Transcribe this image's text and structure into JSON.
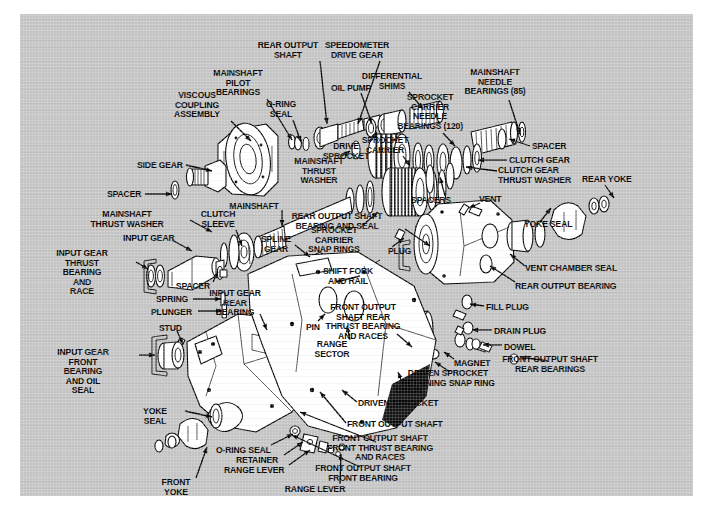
{
  "diagram": {
    "type": "exploded-parts-diagram",
    "background_color": "#c4c4c4",
    "line_color": "#000000",
    "part_fill_color": "#ffffff",
    "canvas": {
      "x": 20,
      "y": 14,
      "width": 673,
      "height": 482
    },
    "labels": [
      {
        "id": "rear-output-shaft",
        "text": "REAR OUTPUT\nSHAFT",
        "x": 268,
        "y": 27,
        "align": "center",
        "leader": [
          [
            300,
            47
          ],
          [
            307,
            110
          ]
        ]
      },
      {
        "id": "speedometer-drive-gear",
        "text": "SPEEDOMETER\nDRIVE GEAR",
        "x": 337,
        "y": 27,
        "align": "center",
        "leader": [
          [
            360,
            47
          ],
          [
            338,
            110
          ]
        ]
      },
      {
        "id": "mainshaft-pilot-bearings",
        "text": "MAINSHAFT\nPILOT\nBEARINGS",
        "x": 218,
        "y": 55,
        "align": "center",
        "leader": [
          [
            247,
            85
          ],
          [
            272,
            126
          ]
        ]
      },
      {
        "id": "differential-shims",
        "text": "DIFFERENTIAL\nSHIMS",
        "x": 372,
        "y": 58,
        "align": "center",
        "leader": [
          [
            389,
            78
          ],
          [
            403,
            95
          ]
        ]
      },
      {
        "id": "mainshaft-needle-bearings",
        "text": "MAINSHAFT\nNEEDLE\nBEARINGS (85)",
        "x": 475,
        "y": 54,
        "align": "center",
        "leader": [
          [
            489,
            86
          ],
          [
            500,
            120
          ]
        ]
      },
      {
        "id": "oil-pump",
        "text": "OIL PUMP",
        "x": 311,
        "y": 70,
        "align": "left",
        "leader": [
          [
            341,
            79
          ],
          [
            352,
            110
          ]
        ]
      },
      {
        "id": "viscous-coupling-assembly",
        "text": "VISCOUS\nCOUPLING\nASSEMBLY",
        "x": 177,
        "y": 77,
        "align": "center",
        "leader": [
          [
            211,
            107
          ],
          [
            231,
            127
          ]
        ]
      },
      {
        "id": "o-ring-seal-top",
        "text": "O-RING\nSEAL",
        "x": 261,
        "y": 86,
        "align": "center",
        "leader": [
          [
            273,
            106
          ],
          [
            281,
            128
          ]
        ]
      },
      {
        "id": "sprocket-carrier-needle-bearings",
        "text": "SPROCKET\nCARRIER\nNEEDLE\nBEARINGS (120)",
        "x": 410,
        "y": 79,
        "align": "center",
        "leader": [
          [
            423,
            119
          ],
          [
            435,
            132
          ]
        ]
      },
      {
        "id": "drive-sprocket",
        "text": "DRIVE\nSPROCKET",
        "x": 326,
        "y": 128,
        "align": "center",
        "leader": [
          [
            350,
            128
          ],
          [
            357,
            118
          ]
        ]
      },
      {
        "id": "spacer-top-right",
        "text": "SPACER",
        "x": 512,
        "y": 128,
        "align": "left",
        "leader": [
          [
            510,
            132
          ],
          [
            489,
            125
          ]
        ]
      },
      {
        "id": "sprocket-carrier",
        "text": "SPROCKET\nCARRIER",
        "x": 365,
        "y": 122,
        "align": "center",
        "leader": [
          [
            383,
            142
          ],
          [
            390,
            152
          ]
        ]
      },
      {
        "id": "side-gear",
        "text": "SIDE GEAR",
        "x": 117,
        "y": 147,
        "align": "left",
        "leader": [
          [
            166,
            151
          ],
          [
            192,
            157
          ]
        ]
      },
      {
        "id": "clutch-gear",
        "text": "CLUTCH GEAR",
        "x": 489,
        "y": 142,
        "align": "left",
        "leader": [
          [
            487,
            146
          ],
          [
            458,
            146
          ]
        ]
      },
      {
        "id": "clutch-gear-thrust-washer",
        "text": "CLUTCH GEAR\nTHRUST WASHER",
        "x": 478,
        "y": 152,
        "align": "left",
        "leader": [
          [
            477,
            157
          ],
          [
            446,
            153
          ]
        ]
      },
      {
        "id": "mainshaft-thrust-washer-top",
        "text": "MAINSHAFT\nTHRUST\nWASHER",
        "x": 299,
        "y": 143,
        "align": "center",
        "leader": [
          [
            320,
            143
          ],
          [
            330,
            137
          ]
        ]
      },
      {
        "id": "rear-yoke",
        "text": "REAR YOKE",
        "x": 562,
        "y": 161,
        "align": "left",
        "leader": [
          [
            585,
            171
          ],
          [
            594,
            184
          ]
        ]
      },
      {
        "id": "spacer-left",
        "text": "SPACER",
        "x": 87,
        "y": 176,
        "align": "left",
        "leader": [
          [
            125,
            180
          ],
          [
            152,
            180
          ]
        ]
      },
      {
        "id": "mainshaft-thrust-washer-left",
        "text": "MAINSHAFT\nTHRUST WASHER",
        "x": 107,
        "y": 196,
        "align": "center",
        "leader": [
          [
            170,
            206
          ],
          [
            192,
            218
          ]
        ]
      },
      {
        "id": "clutch-sleeve",
        "text": "CLUTCH\nSLEEVE",
        "x": 198,
        "y": 196,
        "align": "center",
        "leader": [
          [
            216,
            216
          ],
          [
            222,
            232
          ]
        ]
      },
      {
        "id": "mainshaft",
        "text": "MAINSHAFT",
        "x": 234,
        "y": 188,
        "align": "center",
        "leader": [
          [
            262,
            196
          ],
          [
            262,
            212
          ]
        ]
      },
      {
        "id": "spacers-group",
        "text": "SPACERS",
        "x": 411,
        "y": 182,
        "align": "center",
        "leader": [
          [
            425,
            182
          ],
          [
            420,
            163
          ]
        ]
      },
      {
        "id": "vent",
        "text": "VENT",
        "x": 459,
        "y": 181,
        "align": "left",
        "leader": [
          [
            460,
            189
          ],
          [
            449,
            194
          ]
        ]
      },
      {
        "id": "rear-output-shaft-bearing-and-seal",
        "text": "REAR OUTPUT SHAFT\nBEARING AND SEAL",
        "x": 317,
        "y": 198,
        "align": "center",
        "leader": [
          [
            385,
            215
          ],
          [
            410,
            232
          ]
        ]
      },
      {
        "id": "input-gear",
        "text": "INPUT GEAR",
        "x": 103,
        "y": 220,
        "align": "left",
        "leader": [
          [
            152,
            226
          ],
          [
            172,
            237
          ]
        ]
      },
      {
        "id": "spline-gear",
        "text": "SPLINE\nGEAR",
        "x": 256,
        "y": 221,
        "align": "center",
        "leader": [
          [
            275,
            231
          ],
          [
            290,
            243
          ]
        ]
      },
      {
        "id": "sprocket-carrier-snap-rings",
        "text": "SPROCKET\nCARRIER\nSNAP RINGS",
        "x": 314,
        "y": 212,
        "align": "center",
        "leader": [
          [
            342,
            212
          ],
          [
            358,
            198
          ]
        ]
      },
      {
        "id": "yoke-seal-right",
        "text": "YOKE SEAL",
        "x": 504,
        "y": 206,
        "align": "left",
        "leader": [
          [
            520,
            208
          ],
          [
            531,
            194
          ]
        ]
      },
      {
        "id": "plug",
        "text": "PLUG",
        "x": 368,
        "y": 233,
        "align": "left",
        "leader": [
          [
            372,
            233
          ],
          [
            384,
            224
          ]
        ]
      },
      {
        "id": "input-gear-thrust-bearing-and-race",
        "text": "INPUT GEAR\nTHRUST\nBEARING\nAND\nRACE",
        "x": 62,
        "y": 235,
        "align": "center",
        "leader": [
          [
            116,
            248
          ],
          [
            128,
            255
          ]
        ]
      },
      {
        "id": "shift-fork-and-rail",
        "text": "SHIFT FORK\nAND RAIL",
        "x": 328,
        "y": 253,
        "align": "center",
        "leader": [
          [
            340,
            262
          ],
          [
            316,
            268
          ]
        ]
      },
      {
        "id": "vent-chamber-seal",
        "text": "VENT CHAMBER SEAL",
        "x": 505,
        "y": 250,
        "align": "left",
        "leader": [
          [
            505,
            252
          ],
          [
            490,
            240
          ]
        ]
      },
      {
        "id": "spacer-mid",
        "text": "SPACER",
        "x": 173,
        "y": 268,
        "align": "center",
        "leader": [
          [
            193,
            268
          ],
          [
            198,
            258
          ]
        ]
      },
      {
        "id": "spring",
        "text": "SPRING",
        "x": 136,
        "y": 281,
        "align": "left",
        "leader": [
          [
            173,
            285
          ],
          [
            201,
            285
          ]
        ]
      },
      {
        "id": "input-gear-rear-bearing",
        "text": "INPUT GEAR\nREAR\nBEARING",
        "x": 215,
        "y": 275,
        "align": "center",
        "leader": [
          [
            240,
            300
          ],
          [
            247,
            316
          ]
        ]
      },
      {
        "id": "rear-output-bearing",
        "text": "REAR OUTPUT BEARING",
        "x": 495,
        "y": 268,
        "align": "left",
        "leader": [
          [
            495,
            268
          ],
          [
            470,
            252
          ]
        ]
      },
      {
        "id": "plunger",
        "text": "PLUNGER",
        "x": 131,
        "y": 294,
        "align": "left",
        "leader": [
          [
            178,
            297
          ],
          [
            202,
            297
          ]
        ]
      },
      {
        "id": "front-output-shaft-rear-thrust-bearing-and-races",
        "text": "FRONT OUTPUT\nSHAFT REAR\nTHRUST BEARING\nAND RACES",
        "x": 343,
        "y": 289,
        "align": "center",
        "leader": [
          [
            377,
            320
          ],
          [
            392,
            333
          ]
        ]
      },
      {
        "id": "fill-plug",
        "text": "FILL PLUG",
        "x": 466,
        "y": 289,
        "align": "left",
        "leader": [
          [
            464,
            292
          ],
          [
            450,
            290
          ]
        ]
      },
      {
        "id": "pin",
        "text": "PIN",
        "x": 286,
        "y": 309,
        "align": "left",
        "leader": [
          [
            298,
            307
          ],
          [
            305,
            300
          ]
        ]
      },
      {
        "id": "stud",
        "text": "STUD",
        "x": 139,
        "y": 310,
        "align": "left",
        "leader": [
          [
            157,
            317
          ],
          [
            163,
            330
          ]
        ]
      },
      {
        "id": "drain-plug",
        "text": "DRAIN PLUG",
        "x": 474,
        "y": 313,
        "align": "left",
        "leader": [
          [
            472,
            316
          ],
          [
            452,
            316
          ]
        ]
      },
      {
        "id": "range-sector",
        "text": "RANGE\nSECTOR",
        "x": 312,
        "y": 326,
        "align": "center",
        "leader": [
          [
            330,
            326
          ],
          [
            327,
            312
          ]
        ]
      },
      {
        "id": "dowel",
        "text": "DOWEL",
        "x": 484,
        "y": 329,
        "align": "left",
        "leader": [
          [
            482,
            331
          ],
          [
            463,
            331
          ]
        ]
      },
      {
        "id": "input-gear-front-bearing-and-oil-seal",
        "text": "INPUT GEAR\nFRONT\nBEARING\nAND OIL\nSEAL",
        "x": 63,
        "y": 334,
        "align": "center",
        "leader": [
          [
            119,
            341
          ],
          [
            135,
            341
          ]
        ]
      },
      {
        "id": "magnet",
        "text": "MAGNET",
        "x": 434,
        "y": 345,
        "align": "left",
        "leader": [
          [
            434,
            345
          ],
          [
            424,
            338
          ]
        ]
      },
      {
        "id": "front-output-shaft-rear-bearings",
        "text": "FRONT OUTPUT SHAFT\nREAR BEARINGS",
        "x": 530,
        "y": 341,
        "align": "center",
        "leader": [
          [
            528,
            347
          ],
          [
            500,
            343
          ]
        ]
      },
      {
        "id": "driven-sprocket-retaining-snap-ring",
        "text": "DRIVEN SPROCKET\nRETAINING SNAP RING",
        "x": 428,
        "y": 355,
        "align": "center",
        "leader": [
          [
            430,
            358
          ],
          [
            415,
            348
          ]
        ]
      },
      {
        "id": "chain",
        "text": "CHAIN",
        "x": 375,
        "y": 372,
        "align": "left",
        "leader": [
          [
            383,
            371
          ],
          [
            378,
            358
          ]
        ]
      },
      {
        "id": "yoke-seal-left",
        "text": "YOKE\nSEAL",
        "x": 135,
        "y": 393,
        "align": "center",
        "leader": [
          [
            165,
            397
          ],
          [
            192,
            403
          ]
        ]
      },
      {
        "id": "driven-sprocket",
        "text": "DRIVEN SPROCKET",
        "x": 338,
        "y": 385,
        "align": "left",
        "leader": [
          [
            337,
            388
          ],
          [
            322,
            376
          ]
        ]
      },
      {
        "id": "front-output-shaft",
        "text": "FRONT OUTPUT SHAFT",
        "x": 327,
        "y": 406,
        "align": "left",
        "leader": [
          [
            326,
            409
          ],
          [
            300,
            378
          ]
        ]
      },
      {
        "id": "o-ring-seal-bottom",
        "text": "O-RING SEAL",
        "x": 196,
        "y": 432,
        "align": "left",
        "leader": [
          [
            251,
            431
          ],
          [
            273,
            420
          ]
        ]
      },
      {
        "id": "retainer",
        "text": "RETAINER",
        "x": 216,
        "y": 442,
        "align": "left",
        "leader": [
          [
            264,
            441
          ],
          [
            283,
            428
          ]
        ]
      },
      {
        "id": "range-lever",
        "text": "RANGE LEVER",
        "x": 204,
        "y": 452,
        "align": "left",
        "leader": [
          [
            269,
            451
          ],
          [
            290,
            436
          ]
        ]
      },
      {
        "id": "front-output-shaft-front-thrust-bearing-and-races",
        "text": "FRONT OUTPUT SHAFT\nFRONT THRUST BEARING\nAND RACES",
        "x": 360,
        "y": 420,
        "align": "center",
        "leader": [
          [
            356,
            428
          ],
          [
            280,
            398
          ]
        ]
      },
      {
        "id": "front-output-shaft-front-bearing",
        "text": "FRONT OUTPUT SHAFT\nFRONT BEARING",
        "x": 343,
        "y": 450,
        "align": "center",
        "leader": [
          [
            340,
            453
          ],
          [
            272,
            421
          ]
        ]
      },
      {
        "id": "front-yoke",
        "text": "FRONT\nYOKE",
        "x": 156,
        "y": 464,
        "align": "center",
        "leader": [
          [
            176,
            464
          ],
          [
            187,
            433
          ]
        ]
      },
      {
        "id": "range-lever-collar",
        "text": "RANGE LEVER\nCOLLAR",
        "x": 295,
        "y": 471,
        "align": "center",
        "leader": [
          [
            320,
            470
          ],
          [
            321,
            440
          ]
        ]
      }
    ]
  }
}
